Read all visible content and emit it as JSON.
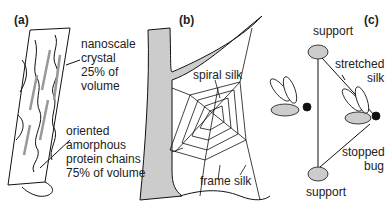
{
  "panels": {
    "a": {
      "label": "(a)",
      "crystal_lines": [
        "nanoscale",
        "crystal",
        "25% of",
        "volume"
      ],
      "amorphous_lines": [
        "oriented",
        "amorphous",
        "protein chains",
        "75% of volume"
      ]
    },
    "b": {
      "label": "(b)",
      "spiral_label": "spiral silk",
      "frame_label": "frame silk"
    },
    "c": {
      "label": "(c)",
      "support_top": "support",
      "support_bottom": "support",
      "stretched_lines": [
        "stretched",
        "silk"
      ],
      "stopped_lines": [
        "stopped",
        "bug"
      ]
    }
  },
  "colors": {
    "line": "#111111",
    "fill_gray": "#cccccc",
    "crystal_gray": "#999999"
  }
}
